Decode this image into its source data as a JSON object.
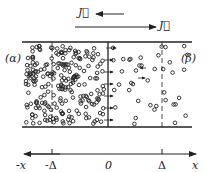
{
  "diagram": {
    "flux_labels": {
      "upper": "J⃗",
      "lower": "J⃗"
    },
    "region_labels": {
      "left": "(α)",
      "right": "(β)"
    },
    "axis": {
      "neg_end": "-x",
      "neg_delta": "-Δ",
      "origin": "0",
      "pos_delta": "Δ",
      "pos_end": "x"
    },
    "colors": {
      "ink": "#222222",
      "background": "#ffffff"
    }
  }
}
